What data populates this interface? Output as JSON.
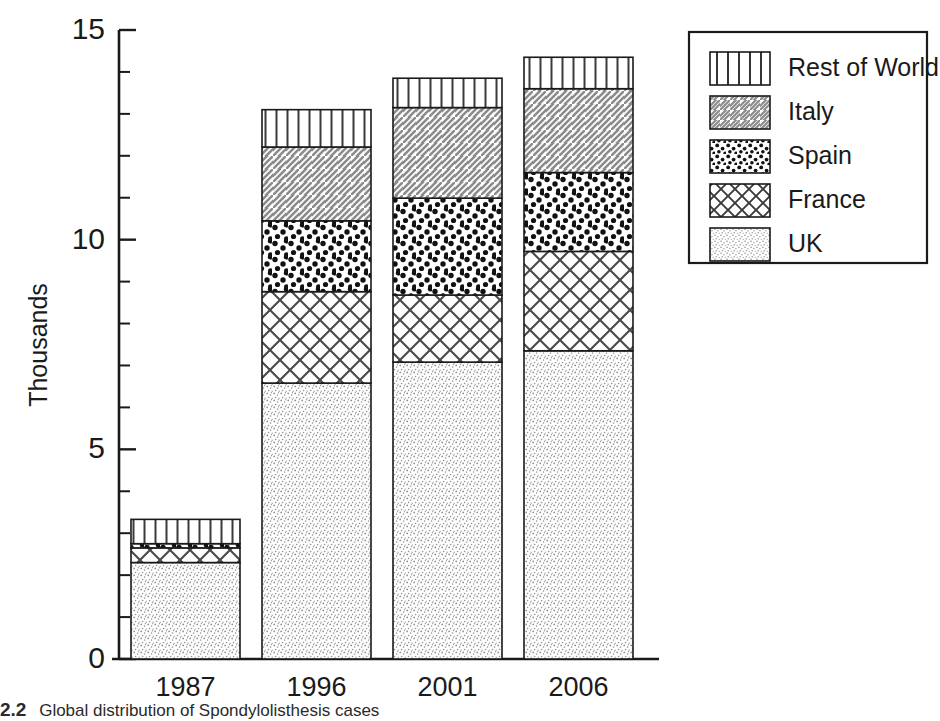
{
  "chart_data": {
    "type": "bar",
    "subtype": "stacked-bar",
    "title": "",
    "xlabel": "",
    "ylabel": "Thousands",
    "ylim": [
      0,
      15
    ],
    "yticks": [
      0,
      5,
      10,
      15
    ],
    "ytick_labels": [
      "0",
      "5",
      "10",
      "15"
    ],
    "yminor_step": 1,
    "grid": false,
    "legend_position": "top-right",
    "categories": [
      "1987",
      "1996",
      "2001",
      "2006"
    ],
    "series": [
      {
        "name": "UK",
        "pattern": "fine-stipple",
        "values": [
          2.3,
          6.58,
          7.08,
          7.35
        ]
      },
      {
        "name": "France",
        "pattern": "cross-hatch",
        "values": [
          0.35,
          2.18,
          1.6,
          2.37
        ]
      },
      {
        "name": "Spain",
        "pattern": "large-dots",
        "values": [
          0.1,
          1.69,
          2.31,
          1.88
        ]
      },
      {
        "name": "Italy",
        "pattern": "diagonal-hatch",
        "values": [
          0.0,
          1.76,
          2.16,
          2.0
        ]
      },
      {
        "name": "Rest of World",
        "pattern": "vertical-lines",
        "values": [
          0.58,
          0.89,
          0.7,
          0.75
        ]
      }
    ],
    "totals": [
      3.33,
      13.1,
      13.85,
      14.35
    ],
    "legend_order": [
      "Rest of World",
      "Italy",
      "Spain",
      "France",
      "UK"
    ]
  },
  "legend": {
    "items": [
      {
        "label": "Rest of World",
        "pattern": "vertical-lines"
      },
      {
        "label": "Italy",
        "pattern": "diagonal-hatch"
      },
      {
        "label": "Spain",
        "pattern": "large-dots"
      },
      {
        "label": "France",
        "pattern": "cross-hatch"
      },
      {
        "label": "UK",
        "pattern": "fine-stipple"
      }
    ]
  },
  "axes": {
    "y_title": "Thousands",
    "y_labels": [
      "15",
      "10",
      "5",
      "0"
    ],
    "x_labels": [
      "1987",
      "1996",
      "2001",
      "2006"
    ]
  },
  "caption": {
    "number": "2.2",
    "text": "Global distribution of Spondylolisthesis cases"
  }
}
